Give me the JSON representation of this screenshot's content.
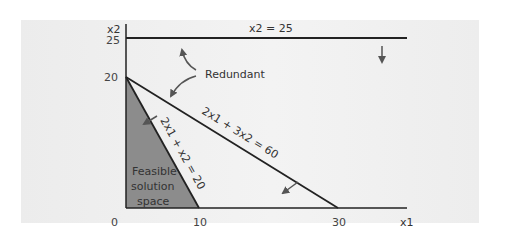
{
  "diagram": {
    "axes": {
      "x_label": "x1",
      "y_label": "x2",
      "x_ticks": [
        "0",
        "10",
        "30"
      ],
      "y_ticks": [
        "20",
        "25"
      ]
    },
    "constraints": [
      {
        "label": "x2 = 25",
        "note": "redundant"
      },
      {
        "label": "2x1 + 3x2 = 60",
        "note": "redundant"
      },
      {
        "label": "2x1 + x2 = 20",
        "note": "binding"
      }
    ],
    "annotations": {
      "redundant": "Redundant",
      "feasible_line1": "Feasible",
      "feasible_line2": "solution",
      "feasible_line3": "space"
    },
    "colors": {
      "feasible_fill": "#8c8c8c",
      "line": "#222222",
      "arrow": "#555555",
      "panel": "#efefef"
    }
  }
}
